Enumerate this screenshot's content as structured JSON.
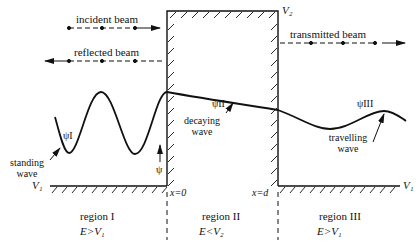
{
  "diagram": {
    "beams": {
      "incident": "incident beam",
      "reflected": "reflected beam",
      "transmitted": "transmitted beam"
    },
    "potentials": {
      "barrier": "V₂",
      "left_floor": "V₁",
      "right_floor": "V₁"
    },
    "wavefunctions": {
      "region1": "ψI",
      "region2": "ψII",
      "region3": "ψIII",
      "axis": "ψ"
    },
    "wave_labels": {
      "standing_line1": "standing",
      "standing_line2": "wave",
      "decaying_line1": "decaying",
      "decaying_line2": "wave",
      "travelling_line1": "travelling",
      "travelling_line2": "wave"
    },
    "boundaries": {
      "left": "x=0",
      "right": "x=d"
    },
    "regions": [
      {
        "name": "region I",
        "condition": "E>V₁"
      },
      {
        "name": "region II",
        "condition": "E<V₂"
      },
      {
        "name": "region III",
        "condition": "E>V₁"
      }
    ]
  }
}
